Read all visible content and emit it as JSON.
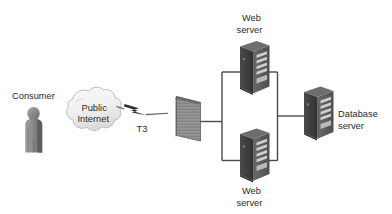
{
  "diagram": {
    "type": "network-topology",
    "title": "",
    "background_color": "#ffffff",
    "text_color": "#2b2b2b",
    "line_color": "#4a4a4a",
    "nodes": [
      {
        "id": "consumer",
        "icon": "person-icon",
        "label": "Consumer",
        "label_lines": [
          "Consumer"
        ],
        "label_position": "above"
      },
      {
        "id": "public-internet",
        "icon": "cloud-icon",
        "label": "Public Internet",
        "label_lines": [
          "Public",
          "Internet"
        ],
        "label_position": "inside"
      },
      {
        "id": "firewall",
        "icon": "firewall-brick-wall-icon",
        "label": "",
        "label_lines": [],
        "label_position": "none"
      },
      {
        "id": "web-server-top",
        "icon": "server-tower-icon",
        "label": "Web server",
        "label_lines": [
          "Web",
          "server"
        ],
        "label_position": "above"
      },
      {
        "id": "web-server-bottom",
        "icon": "server-tower-icon",
        "label": "Web server",
        "label_lines": [
          "Web",
          "server"
        ],
        "label_position": "below"
      },
      {
        "id": "database-server",
        "icon": "server-tower-icon",
        "label": "Database server",
        "label_lines": [
          "Database",
          "server"
        ],
        "label_position": "right"
      }
    ],
    "links": [
      {
        "id": "internet-to-firewall",
        "from": "public-internet",
        "to": "firewall",
        "style": "lightning-bolt",
        "label": "T3"
      },
      {
        "id": "firewall-to-web-bus",
        "from": "firewall",
        "to": "web-server-bus",
        "style": "solid-line",
        "label": ""
      },
      {
        "id": "web-bus-to-database",
        "from": "web-server-bus",
        "to": "database-server",
        "style": "solid-line",
        "label": ""
      }
    ],
    "link_labels": {
      "t3": "T3"
    },
    "node_labels": {
      "consumer": "Consumer",
      "internet_line1": "Public",
      "internet_line2": "Internet",
      "web_top_line1": "Web",
      "web_top_line2": "server",
      "web_bottom_line1": "Web",
      "web_bottom_line2": "server",
      "database_line1": "Database",
      "database_line2": "server"
    },
    "colors": {
      "server_front": "#3a3a3a",
      "server_side": "#5e5e5e",
      "server_top": "#6e6e6e",
      "server_slot": "#c9c9c9",
      "firewall_face": "#8a8a8a",
      "firewall_edge": "#5a5a5a",
      "cloud_fill": "#f2f2f2",
      "cloud_stroke": "#b8b8b8",
      "person_fill": "#8c8c8c",
      "person_dark": "#5d5d5d",
      "bolt_fill": "#2e2e2e"
    }
  }
}
